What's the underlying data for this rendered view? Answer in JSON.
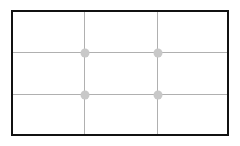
{
  "grid": {
    "type": "rule-of-thirds",
    "columns": 3,
    "rows": 3,
    "border_color": "#111111",
    "line_color": "#b0b0b0",
    "dot_color": "#c8c8c8",
    "intersections": 4
  }
}
